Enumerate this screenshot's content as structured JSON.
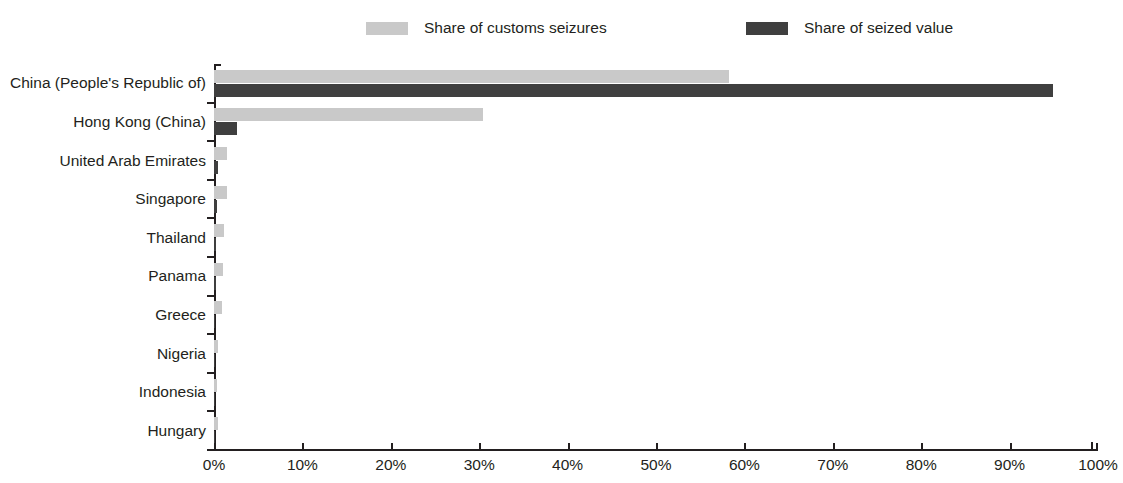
{
  "legend": {
    "position": "top",
    "entries": [
      {
        "label": "Share of customs seizures",
        "color": "#c9c9c9",
        "swatch_name": "legend-swatch-customs-seizures"
      },
      {
        "label": "Share of seized value",
        "color": "#3f3f3f",
        "swatch_name": "legend-swatch-seized-value"
      }
    ]
  },
  "axis": {
    "x_ticks": [
      "0%",
      "10%",
      "20%",
      "30%",
      "40%",
      "50%",
      "60%",
      "70%",
      "80%",
      "90%",
      "100%"
    ]
  },
  "chart_data": {
    "type": "bar",
    "orientation": "horizontal",
    "title": "",
    "subtitle": "",
    "xlabel": "",
    "ylabel": "",
    "xlim": [
      0,
      100
    ],
    "xtick_values": [
      0,
      10,
      20,
      30,
      40,
      50,
      60,
      70,
      80,
      90,
      100
    ],
    "xtick_labels": [
      "0%",
      "10%",
      "20%",
      "30%",
      "40%",
      "50%",
      "60%",
      "70%",
      "80%",
      "90%",
      "100%"
    ],
    "grid": false,
    "legend_position": "top",
    "units": "percent",
    "categories": [
      "China (People's Republic of)",
      "Hong Kong (China)",
      "United Arab Emirates",
      "Singapore",
      "Thailand",
      "Panama",
      "Greece",
      "Nigeria",
      "Indonesia",
      "Hungary"
    ],
    "series": [
      {
        "name": "Share of customs seizures",
        "color": "#c9c9c9",
        "values": [
          58.3,
          30.4,
          1.5,
          1.5,
          1.1,
          1.0,
          0.9,
          0.4,
          0.3,
          0.5
        ]
      },
      {
        "name": "Share of seized value",
        "color": "#3f3f3f",
        "values": [
          94.9,
          2.6,
          0.4,
          0.3,
          0.2,
          0.2,
          0.1,
          0.1,
          0.1,
          0.1
        ]
      }
    ]
  }
}
